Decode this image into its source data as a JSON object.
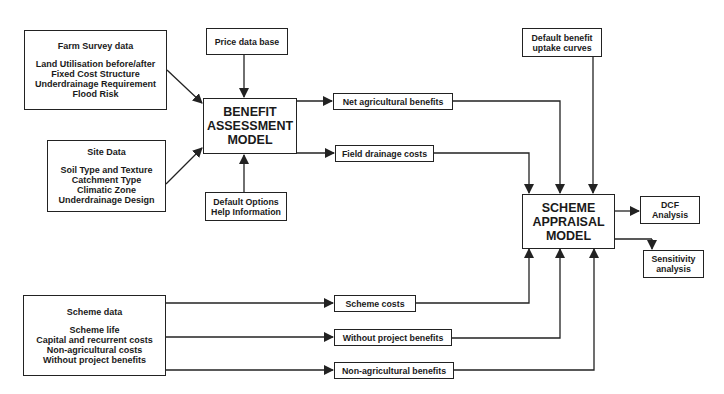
{
  "diagram": {
    "inputs": {
      "farm_survey": {
        "title": "Farm Survey data",
        "items": [
          "Land Utilisation before/after",
          "Fixed Cost Structure",
          "Underdrainage Requirement",
          "Flood Risk"
        ]
      },
      "site_data": {
        "title": "Site Data",
        "items": [
          "Soil Type and Texture",
          "Catchment Type",
          "Climatic Zone",
          "Underdrainage Design"
        ]
      },
      "scheme_data": {
        "title": "Scheme data",
        "items": [
          "Scheme life",
          "Capital and recurrent costs",
          "Non-agricultural costs",
          "Without project benefits"
        ]
      },
      "price_data_base": {
        "label": "Price data base"
      },
      "default_options": {
        "lines": [
          "Default Options",
          "Help Information"
        ]
      },
      "default_benefit_uptake": {
        "lines": [
          "Default benefit",
          "uptake curves"
        ]
      }
    },
    "models": {
      "benefit_assessment": {
        "lines": [
          "BENEFIT",
          "ASSESSMENT",
          "MODEL"
        ]
      },
      "scheme_appraisal": {
        "lines": [
          "SCHEME",
          "APPRAISAL",
          "MODEL"
        ]
      }
    },
    "intermediates": {
      "net_agricultural_benefits": "Net agricultural benefits",
      "field_drainage_costs": "Field drainage costs",
      "scheme_costs": "Scheme costs",
      "without_project_benefits": "Without project benefits",
      "non_agricultural_benefits": "Non-agricultural benefits"
    },
    "outputs": {
      "dcf_analysis": {
        "lines": [
          "DCF",
          "Analysis"
        ]
      },
      "sensitivity_analysis": {
        "lines": [
          "Sensitivity",
          "analysis"
        ]
      }
    },
    "colors": {
      "line": "#222222",
      "background": "#ffffff",
      "text": "#1a1a1a"
    }
  }
}
